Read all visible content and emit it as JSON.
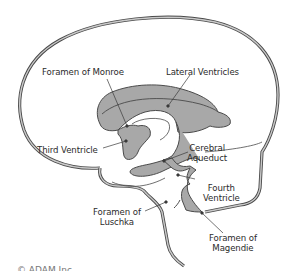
{
  "diagram": {
    "labels": {
      "foramen_monroe": "Foramen of Monroe",
      "lateral_ventricles": "Lateral Ventricles",
      "third_ventricle": "Third Ventricle",
      "cerebral_aqueduct_1": "Cerebral",
      "cerebral_aqueduct_2": "Aqueduct",
      "fourth_ventricle_1": "Fourth",
      "fourth_ventricle_2": "Ventricle",
      "foramen_luschka_1": "Foramen of",
      "foramen_luschka_2": "Luschka",
      "foramen_magendie_1": "Foramen of",
      "foramen_magendie_2": "Magendie"
    },
    "cut_off_caption": "© ADAM Inc",
    "colors": {
      "ventricle_fill": "#a8a8a8",
      "outline": "#4a4a4a",
      "membrane_fill": "#c9c9c9",
      "text": "#2b2b2b"
    }
  }
}
